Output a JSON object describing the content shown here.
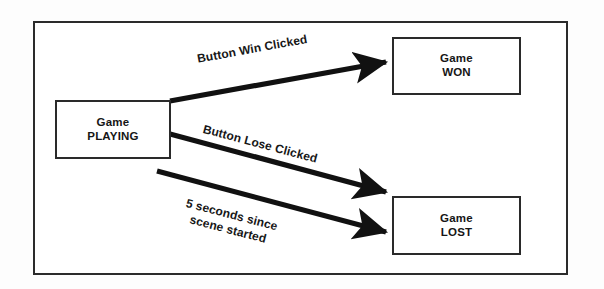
{
  "diagram": {
    "frame": {
      "border_color": "#2b2b2b"
    },
    "states": [
      {
        "id": "playing",
        "line1": "Game",
        "line2": "PLAYING",
        "border_color": "#2a2a2a",
        "fill": "#ffffff"
      },
      {
        "id": "won",
        "line1": "Game",
        "line2": "WON",
        "border_color": "#2a2a2a",
        "fill": "#ffffff"
      },
      {
        "id": "lost",
        "line1": "Game",
        "line2": "LOST",
        "border_color": "#2a2a2a",
        "fill": "#ffffff"
      }
    ],
    "transitions": [
      {
        "id": "win",
        "from": "playing",
        "to": "won",
        "label": "Button Win Clicked",
        "color": "#111111"
      },
      {
        "id": "lose",
        "from": "playing",
        "to": "lost",
        "label": "Button Lose Clicked",
        "color": "#111111"
      },
      {
        "id": "timeout",
        "from": "playing",
        "to": "lost",
        "label_line1": "5 seconds since",
        "label_line2": "scene started",
        "color": "#111111"
      }
    ]
  }
}
